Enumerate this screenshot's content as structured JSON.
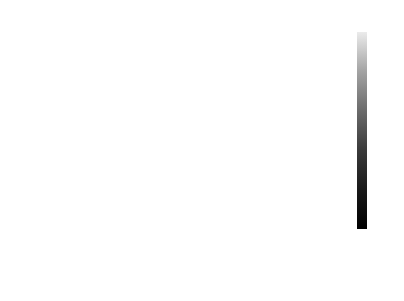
{
  "chart_data": {
    "type": "heatmap",
    "xlabel": "",
    "ylabel": "",
    "labels": [
      "holiday",
      "temp",
      "rain_1h",
      "snow_1h",
      "clouds_all",
      "traffic_volume",
      "time",
      "month",
      "year"
    ],
    "matrix_display": [
      [
        "1",
        "-0.0083",
        "-0.0024",
        "-0.00097",
        "-0.0056",
        "-0.043",
        "-0.058",
        "0.0053",
        "-8.5e-05"
      ],
      [
        "-0.0083",
        "1",
        "0.09",
        "-0.021",
        "-0.11",
        "0.13",
        "0.11",
        "0.23",
        "0.14"
      ],
      [
        "-0.0024",
        "0.09",
        "1",
        "0.0015",
        "0.081",
        "-0.022",
        "-0.011",
        "0.028",
        "-0.033"
      ],
      [
        "-0.00097",
        "-0.021",
        "0.0015",
        "1",
        "0.028",
        "0.00073",
        "0.0098",
        "0.02",
        "-0.0035"
      ],
      [
        "-0.0056",
        "-0.11",
        "0.081",
        "0.028",
        "1",
        "0.067",
        "0.054",
        "-0.0095",
        "-0.073"
      ],
      [
        "-0.043",
        "0.13",
        "-0.022",
        "0.00073",
        "0.067",
        "1",
        "0.35",
        "-0.0028",
        "0.0046"
      ],
      [
        "-0.058",
        "0.11",
        "-0.011",
        "0.0098",
        "0.054",
        "0.35",
        "1",
        "0.0016",
        "-0.0077"
      ],
      [
        "0.0053",
        "0.23",
        "0.028",
        "0.02",
        "-0.0095",
        "-0.0028",
        "0.0016",
        "1",
        "-0.16"
      ],
      [
        "-8.5e-05",
        "0.14",
        "-0.033",
        "-0.0035",
        "-0.073",
        "0.0046",
        "-0.0077",
        "-0.16",
        "1"
      ]
    ],
    "values": [
      [
        1,
        -0.0083,
        -0.0024,
        -0.00097,
        -0.0056,
        -0.043,
        -0.058,
        0.0053,
        -8.5e-05
      ],
      [
        -0.0083,
        1,
        0.09,
        -0.021,
        -0.11,
        0.13,
        0.11,
        0.23,
        0.14
      ],
      [
        -0.0024,
        0.09,
        1,
        0.0015,
        0.081,
        -0.022,
        -0.011,
        0.028,
        -0.033
      ],
      [
        -0.00097,
        -0.021,
        0.0015,
        1,
        0.028,
        0.00073,
        0.0098,
        0.02,
        -0.0035
      ],
      [
        -0.0056,
        -0.11,
        0.081,
        0.028,
        1,
        0.067,
        0.054,
        -0.0095,
        -0.073
      ],
      [
        -0.043,
        0.13,
        -0.022,
        0.00073,
        0.067,
        1,
        0.35,
        -0.0028,
        0.0046
      ],
      [
        -0.058,
        0.11,
        -0.011,
        0.0098,
        0.054,
        0.35,
        1,
        0.0016,
        -0.0077
      ],
      [
        0.0053,
        0.23,
        0.028,
        0.02,
        -0.0095,
        -0.0028,
        0.0016,
        1,
        -0.16
      ],
      [
        -8.5e-05,
        0.14,
        -0.033,
        -0.0035,
        -0.073,
        0.0046,
        -0.0077,
        -0.16,
        1
      ]
    ],
    "colorbar": {
      "ticks": [
        "1.0",
        "0.8",
        "0.6",
        "0.4",
        "0.2",
        "0.0"
      ],
      "range": [
        -0.16,
        1.0
      ],
      "colormap": "gray"
    },
    "grid": false,
    "legend_position": "right (colorbar)"
  }
}
